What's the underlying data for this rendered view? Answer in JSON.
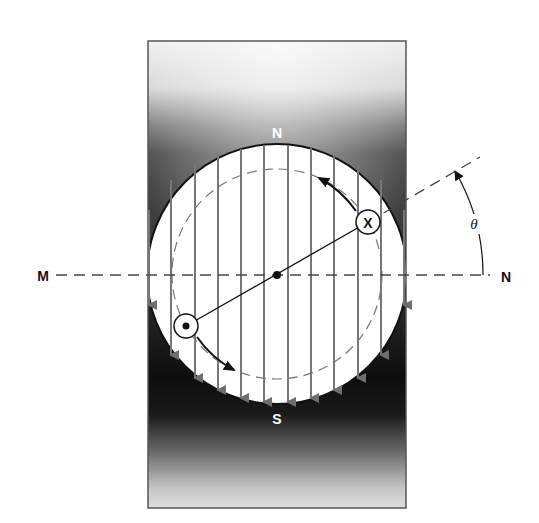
{
  "diagram": {
    "pole_labels": {
      "north": "N",
      "south": "S"
    },
    "axis_labels": {
      "left": "M",
      "right": "N"
    },
    "angle_label": "θ",
    "conductor_labels": {
      "into_page": "X",
      "out_of_page": "•"
    },
    "field_lines": {
      "count": 12,
      "direction": "downward"
    },
    "colors": {
      "pole_dark": "#0d0d0d",
      "pole_light": "#e6e6e6",
      "field_line": "#777777",
      "ink": "#111111",
      "background": "#ffffff"
    }
  }
}
